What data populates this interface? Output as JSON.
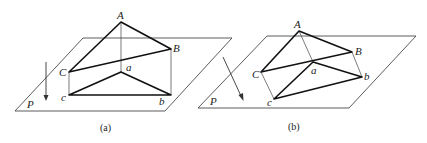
{
  "figure": {
    "panels": [
      {
        "id": "a",
        "caption": "(a)",
        "plane_label": "P",
        "points": {
          "A": "A",
          "B": "B",
          "C": "C",
          "a": "a",
          "b": "b",
          "c": "c"
        },
        "projection": "parallel vertical projection onto plane P"
      },
      {
        "id": "b",
        "caption": "(b)",
        "plane_label": "P",
        "points": {
          "A": "A",
          "B": "B",
          "C": "C",
          "a": "a",
          "b": "b",
          "c": "c"
        },
        "projection": "oblique parallel projection onto plane P"
      }
    ]
  }
}
